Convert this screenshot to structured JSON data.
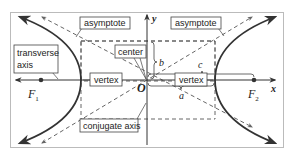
{
  "diagram": {
    "labels": {
      "asymptote_left": "asymptote",
      "asymptote_right": "asymptote",
      "transverse_axis_line1": "transverse",
      "transverse_axis_line2": "axis",
      "center": "center",
      "vertex_left": "vertex",
      "vertex_right": "vertex",
      "conjugate_axis": "conjugate axis"
    },
    "symbols": {
      "y_axis": "y",
      "x_axis": "x",
      "origin": "O",
      "focus1": "F",
      "focus1_sub": "1",
      "focus2": "F",
      "focus2_sub": "2",
      "a": "a",
      "b": "b",
      "c": "c"
    },
    "colors": {
      "curve": "#333333",
      "dashed": "#555555",
      "frame": "#bbbbbb",
      "text": "#222222"
    }
  }
}
